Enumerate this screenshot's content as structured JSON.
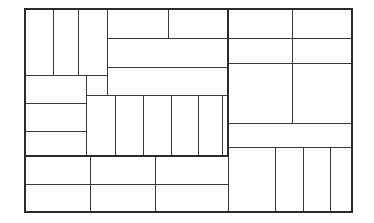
{
  "figure": {
    "type": "rectangle-packing-diagram",
    "title": "",
    "caption": "",
    "background_color": "#ffffff",
    "line_color": "#3a3a3a",
    "thick_line_color": "#2b2b2b",
    "thin_stroke_width": 1,
    "thick_stroke_width": 2.2,
    "canvas": {
      "width": 374,
      "height": 223
    },
    "outer_frame": {
      "x": 25,
      "y": 9,
      "width": 327,
      "height": 203
    },
    "highlighted_subregion": {
      "x": 25,
      "y": 9,
      "width": 203,
      "height": 147
    }
  },
  "chart_data": {
    "type": "table",
    "title": "",
    "xlabel": "",
    "ylabel": "",
    "grid": false,
    "legend_position": "none",
    "xlim": [
      25,
      352
    ],
    "ylim": [
      9,
      212
    ],
    "rectangles": [
      {
        "id": "r1",
        "x": 25,
        "y": 9,
        "w": 28,
        "h": 66
      },
      {
        "id": "r2",
        "x": 53,
        "y": 9,
        "w": 25,
        "h": 66
      },
      {
        "id": "r3",
        "x": 78,
        "y": 9,
        "w": 29,
        "h": 66
      },
      {
        "id": "r4",
        "x": 107,
        "y": 9,
        "w": 61,
        "h": 29
      },
      {
        "id": "r5",
        "x": 168,
        "y": 9,
        "w": 60,
        "h": 29
      },
      {
        "id": "r6",
        "x": 107,
        "y": 38,
        "w": 121,
        "h": 29
      },
      {
        "id": "r7",
        "x": 107,
        "y": 67,
        "w": 121,
        "h": 28
      },
      {
        "id": "r8",
        "x": 25,
        "y": 75,
        "w": 61,
        "h": 28
      },
      {
        "id": "r9",
        "x": 86,
        "y": 75,
        "w": 21,
        "h": 20
      },
      {
        "id": "r10",
        "x": 25,
        "y": 103,
        "w": 61,
        "h": 28
      },
      {
        "id": "r11",
        "x": 25,
        "y": 131,
        "w": 61,
        "h": 25
      },
      {
        "id": "r12",
        "x": 86,
        "y": 95,
        "w": 29,
        "h": 61
      },
      {
        "id": "r13",
        "x": 115,
        "y": 95,
        "w": 28,
        "h": 61
      },
      {
        "id": "r14",
        "x": 143,
        "y": 95,
        "w": 28,
        "h": 61
      },
      {
        "id": "r15",
        "x": 171,
        "y": 95,
        "w": 27,
        "h": 61
      },
      {
        "id": "r16",
        "x": 198,
        "y": 95,
        "w": 24,
        "h": 61
      },
      {
        "id": "r17",
        "x": 222,
        "y": 95,
        "w": 6,
        "h": 61
      },
      {
        "id": "r18",
        "x": 228,
        "y": 9,
        "w": 64,
        "h": 29
      },
      {
        "id": "r19",
        "x": 292,
        "y": 9,
        "w": 60,
        "h": 29
      },
      {
        "id": "r20",
        "x": 228,
        "y": 38,
        "w": 64,
        "h": 25
      },
      {
        "id": "r21",
        "x": 292,
        "y": 38,
        "w": 60,
        "h": 25
      },
      {
        "id": "r22",
        "x": 228,
        "y": 63,
        "w": 64,
        "h": 60
      },
      {
        "id": "r23",
        "x": 292,
        "y": 63,
        "w": 60,
        "h": 60
      },
      {
        "id": "r24",
        "x": 228,
        "y": 123,
        "w": 124,
        "h": 24
      },
      {
        "id": "r25",
        "x": 228,
        "y": 147,
        "w": 47,
        "h": 65
      },
      {
        "id": "r26",
        "x": 275,
        "y": 147,
        "w": 28,
        "h": 65
      },
      {
        "id": "r27",
        "x": 303,
        "y": 147,
        "w": 27,
        "h": 65
      },
      {
        "id": "r28",
        "x": 330,
        "y": 147,
        "w": 22,
        "h": 65
      },
      {
        "id": "r29",
        "x": 25,
        "y": 156,
        "w": 65,
        "h": 28
      },
      {
        "id": "r30",
        "x": 90,
        "y": 156,
        "w": 65,
        "h": 28
      },
      {
        "id": "r31",
        "x": 155,
        "y": 156,
        "w": 73,
        "h": 28
      },
      {
        "id": "r32",
        "x": 25,
        "y": 184,
        "w": 65,
        "h": 28
      },
      {
        "id": "r33",
        "x": 90,
        "y": 184,
        "w": 65,
        "h": 28
      },
      {
        "id": "r34",
        "x": 155,
        "y": 184,
        "w": 73,
        "h": 28
      }
    ],
    "thick_segments": [
      {
        "id": "t1",
        "x1": 25,
        "y1": 9,
        "x2": 352,
        "y2": 9
      },
      {
        "id": "t2",
        "x1": 25,
        "y1": 212,
        "x2": 352,
        "y2": 212
      },
      {
        "id": "t3",
        "x1": 25,
        "y1": 9,
        "x2": 25,
        "y2": 212
      },
      {
        "id": "t4",
        "x1": 352,
        "y1": 9,
        "x2": 352,
        "y2": 212
      },
      {
        "id": "t5",
        "x1": 228,
        "y1": 9,
        "x2": 228,
        "y2": 156
      },
      {
        "id": "t6",
        "x1": 25,
        "y1": 156,
        "x2": 228,
        "y2": 156
      }
    ]
  }
}
